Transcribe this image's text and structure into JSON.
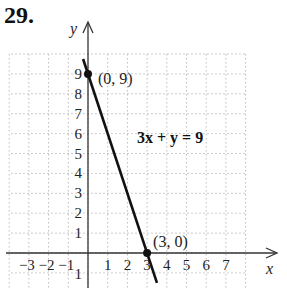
{
  "problem_number": "29.",
  "chart_data": {
    "type": "line",
    "title": "",
    "equation": "3x + y = 9",
    "xlabel": "x",
    "ylabel": "y",
    "xlim": [
      -4,
      8
    ],
    "ylim": [
      -1,
      10
    ],
    "grid": true,
    "x_ticks": [
      "-3",
      "-2",
      "-1",
      "1",
      "2",
      "3",
      "4",
      "5",
      "6",
      "7"
    ],
    "y_ticks": [
      "-1",
      "1",
      "2",
      "3",
      "4",
      "5",
      "6",
      "7",
      "8",
      "9"
    ],
    "series": [
      {
        "name": "3x + y = 9",
        "x": [
          -0.25,
          3.5
        ],
        "y": [
          9.75,
          -1.5
        ]
      }
    ],
    "points": [
      {
        "x": 0,
        "y": 9,
        "label": "(0, 9)"
      },
      {
        "x": 3,
        "y": 0,
        "label": "(3, 0)"
      }
    ]
  }
}
